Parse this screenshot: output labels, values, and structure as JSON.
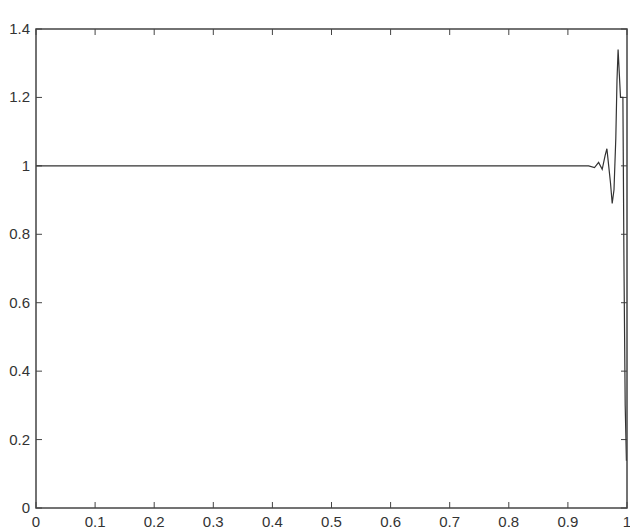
{
  "chart_data": {
    "type": "line",
    "title": "",
    "xlabel": "",
    "ylabel": "",
    "xlim": [
      0,
      1
    ],
    "ylim": [
      0,
      1.4
    ],
    "grid": false,
    "legend": null,
    "x_ticks": [
      "0",
      "0.1",
      "0.2",
      "0.3",
      "0.4",
      "0.5",
      "0.6",
      "0.7",
      "0.8",
      "0.9",
      "1"
    ],
    "y_ticks": [
      "0",
      "0.2",
      "0.4",
      "0.6",
      "0.8",
      "1",
      "1.2",
      "1.4"
    ],
    "series": [
      {
        "name": "signal",
        "color": "#333333",
        "x": [
          0,
          0.1,
          0.5,
          0.9,
          0.935,
          0.945,
          0.952,
          0.958,
          0.963,
          0.966,
          0.969,
          0.972,
          0.975,
          0.978,
          0.981,
          0.983,
          0.985,
          0.987,
          0.989,
          0.991,
          0.993,
          0.995,
          0.997,
          0.999,
          1.0
        ],
        "y": [
          1.0,
          1.0,
          1.0,
          1.0,
          1.0,
          0.995,
          1.01,
          0.99,
          1.03,
          1.05,
          1.0,
          0.95,
          0.89,
          0.93,
          1.08,
          1.25,
          1.34,
          1.27,
          1.2,
          1.2,
          1.2,
          0.7,
          0.3,
          0.14,
          0.14
        ]
      }
    ]
  }
}
